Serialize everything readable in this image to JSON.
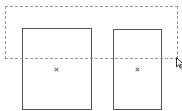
{
  "canvas": {
    "width": 182,
    "height": 111,
    "background": "#ffffff"
  },
  "shapes": [
    {
      "name": "rectangle-1",
      "x": 22,
      "y": 28,
      "width": 70,
      "height": 82,
      "stroke": "#555555",
      "center": {
        "x": 56,
        "y": 69
      }
    },
    {
      "name": "rectangle-2",
      "x": 113,
      "y": 29,
      "width": 49,
      "height": 81,
      "stroke": "#555555",
      "center": {
        "x": 137,
        "y": 69
      }
    }
  ],
  "selection": {
    "x": 5,
    "y": 6,
    "width": 173,
    "height": 53,
    "stroke": "#999999",
    "style": "dashed"
  },
  "cursor": {
    "icon": "arrow-pointer-icon",
    "x": 176,
    "y": 57
  }
}
